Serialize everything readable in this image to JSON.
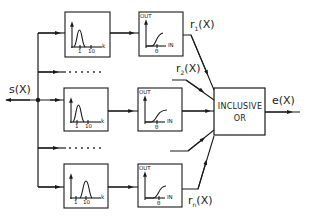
{
  "diagram": {
    "input_signal": "s(X)",
    "output_signal": "e(X)",
    "combiner": {
      "line1": "INCLUSIVE",
      "line2": "OR"
    },
    "channels": [
      {
        "id": "channel-1",
        "filter": {
          "tick1": "1",
          "tick2": "10",
          "axis": "k",
          "peak": "low"
        },
        "threshold": {
          "out_label": "OUT",
          "in_label": "IN",
          "theta": "θ"
        },
        "output": "r1(X)",
        "output_main": "r",
        "output_sub": "1",
        "output_arg": "(X)"
      },
      {
        "id": "channel-2",
        "output": "r2(X)",
        "output_main": "r",
        "output_sub": "2",
        "output_arg": "(X)"
      },
      {
        "id": "channel-mid",
        "filter": {
          "tick1": "1",
          "tick2": "10",
          "axis": "k",
          "peak": "low"
        },
        "threshold": {
          "out_label": "OUT",
          "in_label": "IN",
          "theta": "θ"
        }
      },
      {
        "id": "channel-n",
        "filter": {
          "tick1": "1",
          "tick2": "10",
          "axis": "k",
          "peak": "high"
        },
        "threshold": {
          "out_label": "OUT",
          "in_label": "IN",
          "theta": "θ"
        },
        "output": "rn(X)",
        "output_main": "r",
        "output_sub": "n",
        "output_arg": "(X)"
      }
    ],
    "ellipsis": "......",
    "colors": {
      "stroke": "#1a1a1a",
      "background": "#ffffff"
    }
  }
}
